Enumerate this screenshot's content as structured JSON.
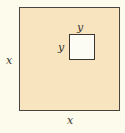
{
  "diagram": {
    "outer_square": {
      "side_label_left": "x",
      "side_label_bottom": "x",
      "fill_color": "#f8e4bf"
    },
    "inner_square": {
      "side_label_top": "y",
      "side_label_left": "y",
      "fill_color": "#fdfcf4"
    },
    "background_color": "#fdfbeb",
    "stroke_color": "#3a3530"
  }
}
